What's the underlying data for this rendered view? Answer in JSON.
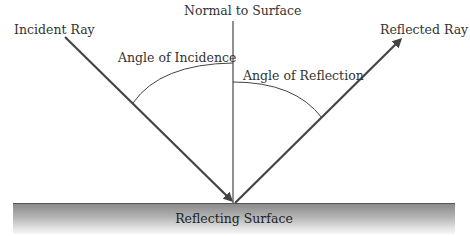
{
  "diagram": {
    "labels": {
      "normal": "Normal to Surface",
      "incident_ray": "Incident Ray",
      "reflected_ray": "Reflected Ray",
      "angle_incidence": "Angle of Incidence",
      "angle_reflection": "Angle of Reflection",
      "surface": "Reflecting Surface"
    },
    "colors": {
      "line": "#444444",
      "text": "#333333",
      "surface_top": "#8a8a8a",
      "surface_bottom": "#f7f7f7"
    }
  }
}
